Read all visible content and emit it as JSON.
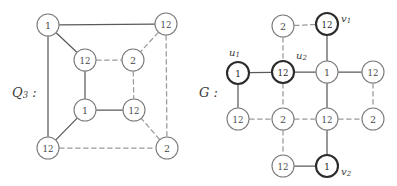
{
  "figure": {
    "type": "graph-diagram",
    "background": "#ffffff",
    "solid_edge_color": "#5a5a5a",
    "dashed_edge_color": "#9a9a9a",
    "node_stroke_color": "#7a7a7a",
    "bold_node_stroke_color": "#2b2b2b",
    "node_text_color": "#4a4a4a"
  },
  "left_graph": {
    "name": "Q_3",
    "label_main": "Q",
    "label_sub": "3",
    "label_colon": " :",
    "nodes": [
      {
        "id": "o-tl",
        "label": "1",
        "cx": 48,
        "cy": 25,
        "r": 11,
        "bold": false
      },
      {
        "id": "o-tr",
        "label": "12",
        "cx": 166,
        "cy": 24,
        "r": 11,
        "bold": false
      },
      {
        "id": "o-bl",
        "label": "12",
        "cx": 48,
        "cy": 148,
        "r": 11,
        "bold": false
      },
      {
        "id": "o-br",
        "label": "2",
        "cx": 167,
        "cy": 148,
        "r": 11,
        "bold": false
      },
      {
        "id": "i-tl",
        "label": "12",
        "cx": 85,
        "cy": 60,
        "r": 11,
        "bold": false
      },
      {
        "id": "i-tr",
        "label": "2",
        "cx": 133,
        "cy": 60,
        "r": 11,
        "bold": false
      },
      {
        "id": "i-bl",
        "label": "1",
        "cx": 85,
        "cy": 110,
        "r": 11,
        "bold": false
      },
      {
        "id": "i-br",
        "label": "12",
        "cx": 134,
        "cy": 110,
        "r": 11,
        "bold": false
      }
    ],
    "edges": [
      {
        "from": "o-tl",
        "to": "o-tr",
        "style": "solid"
      },
      {
        "from": "o-tl",
        "to": "o-bl",
        "style": "solid"
      },
      {
        "from": "o-bl",
        "to": "o-br",
        "style": "dashed"
      },
      {
        "from": "o-tr",
        "to": "o-br",
        "style": "dashed"
      },
      {
        "from": "i-tl",
        "to": "i-tr",
        "style": "dashed"
      },
      {
        "from": "i-tl",
        "to": "i-bl",
        "style": "solid"
      },
      {
        "from": "i-bl",
        "to": "i-br",
        "style": "solid"
      },
      {
        "from": "i-tr",
        "to": "i-br",
        "style": "dashed"
      },
      {
        "from": "o-tl",
        "to": "i-tl",
        "style": "solid"
      },
      {
        "from": "o-tr",
        "to": "i-tr",
        "style": "dashed"
      },
      {
        "from": "o-bl",
        "to": "i-bl",
        "style": "solid"
      },
      {
        "from": "o-br",
        "to": "i-br",
        "style": "dashed"
      }
    ]
  },
  "right_graph": {
    "name": "G",
    "label_main": "G",
    "label_colon": " :",
    "nodes": [
      {
        "id": "n-2top",
        "label": "2",
        "cx": 283,
        "cy": 26,
        "r": 11,
        "bold": false
      },
      {
        "id": "n-v1",
        "label": "12",
        "cx": 327,
        "cy": 24,
        "r": 11,
        "bold": true
      },
      {
        "id": "n-u1",
        "label": "1",
        "cx": 238,
        "cy": 73,
        "r": 11,
        "bold": true
      },
      {
        "id": "n-u2",
        "label": "12",
        "cx": 283,
        "cy": 72,
        "r": 11,
        "bold": true
      },
      {
        "id": "n-1mid",
        "label": "1",
        "cx": 327,
        "cy": 72,
        "r": 11,
        "bold": false
      },
      {
        "id": "n-12re",
        "label": "12",
        "cx": 373,
        "cy": 72,
        "r": 11,
        "bold": false
      },
      {
        "id": "n-12bl",
        "label": "12",
        "cx": 238,
        "cy": 119,
        "r": 11,
        "bold": false
      },
      {
        "id": "n-2b1",
        "label": "2",
        "cx": 283,
        "cy": 119,
        "r": 11,
        "bold": false
      },
      {
        "id": "n-12b2",
        "label": "12",
        "cx": 327,
        "cy": 119,
        "r": 11,
        "bold": false
      },
      {
        "id": "n-2br",
        "label": "2",
        "cx": 373,
        "cy": 119,
        "r": 11,
        "bold": false
      },
      {
        "id": "n-12bot",
        "label": "12",
        "cx": 283,
        "cy": 166,
        "r": 11,
        "bold": false
      },
      {
        "id": "n-v2",
        "label": "1",
        "cx": 327,
        "cy": 166,
        "r": 11,
        "bold": true
      }
    ],
    "edges": [
      {
        "from": "n-2top",
        "to": "n-v1",
        "style": "dashed"
      },
      {
        "from": "n-2top",
        "to": "n-u2",
        "style": "dashed"
      },
      {
        "from": "n-v1",
        "to": "n-1mid",
        "style": "solid"
      },
      {
        "from": "n-u1",
        "to": "n-u2",
        "style": "solid"
      },
      {
        "from": "n-u2",
        "to": "n-1mid",
        "style": "solid"
      },
      {
        "from": "n-1mid",
        "to": "n-12re",
        "style": "solid"
      },
      {
        "from": "n-u1",
        "to": "n-12bl",
        "style": "solid"
      },
      {
        "from": "n-u2",
        "to": "n-2b1",
        "style": "dashed"
      },
      {
        "from": "n-1mid",
        "to": "n-12b2",
        "style": "solid"
      },
      {
        "from": "n-12re",
        "to": "n-2br",
        "style": "dashed"
      },
      {
        "from": "n-12bl",
        "to": "n-2b1",
        "style": "dashed"
      },
      {
        "from": "n-2b1",
        "to": "n-12b2",
        "style": "dashed"
      },
      {
        "from": "n-12b2",
        "to": "n-2br",
        "style": "dashed"
      },
      {
        "from": "n-2b1",
        "to": "n-12bot",
        "style": "dashed"
      },
      {
        "from": "n-12b2",
        "to": "n-v2",
        "style": "solid"
      },
      {
        "from": "n-12bot",
        "to": "n-v2",
        "style": "solid"
      }
    ],
    "vertex_labels": [
      {
        "id": "lbl-u1",
        "main": "u",
        "sub": "1",
        "x": 229,
        "y": 52,
        "anchor": "start"
      },
      {
        "id": "lbl-u2",
        "main": "u",
        "sub": "2",
        "x": 296,
        "y": 55,
        "anchor": "start"
      },
      {
        "id": "lbl-v1",
        "main": "v",
        "sub": "1",
        "x": 341,
        "y": 18,
        "anchor": "start"
      },
      {
        "id": "lbl-v2",
        "main": "v",
        "sub": "2",
        "x": 341,
        "y": 171,
        "anchor": "start"
      }
    ]
  }
}
